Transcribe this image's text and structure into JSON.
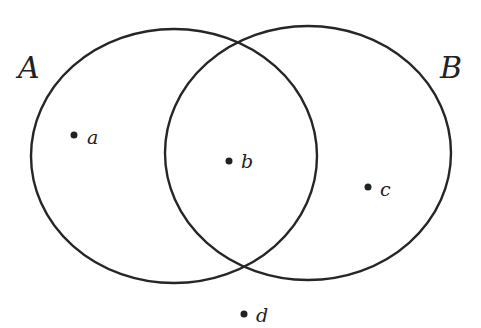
{
  "diagram": {
    "type": "venn",
    "sets": [
      {
        "id": "A",
        "label": "A",
        "cx": 174,
        "cy": 156,
        "rx": 143,
        "ry": 127,
        "label_x": 18,
        "label_y": 78
      },
      {
        "id": "B",
        "label": "B",
        "cx": 308,
        "cy": 153,
        "rx": 143,
        "ry": 127,
        "label_x": 440,
        "label_y": 78
      }
    ],
    "points": [
      {
        "id": "a",
        "label": "a",
        "x": 74,
        "y": 135,
        "region": "A only"
      },
      {
        "id": "b",
        "label": "b",
        "x": 229,
        "y": 161,
        "region": "A and B"
      },
      {
        "id": "c",
        "label": "c",
        "x": 368,
        "y": 187,
        "region": "B only"
      },
      {
        "id": "d",
        "label": "d",
        "x": 244,
        "y": 314,
        "region": "outside A and B"
      }
    ],
    "colors": {
      "stroke": "#262626",
      "background": "#ffffff"
    }
  }
}
